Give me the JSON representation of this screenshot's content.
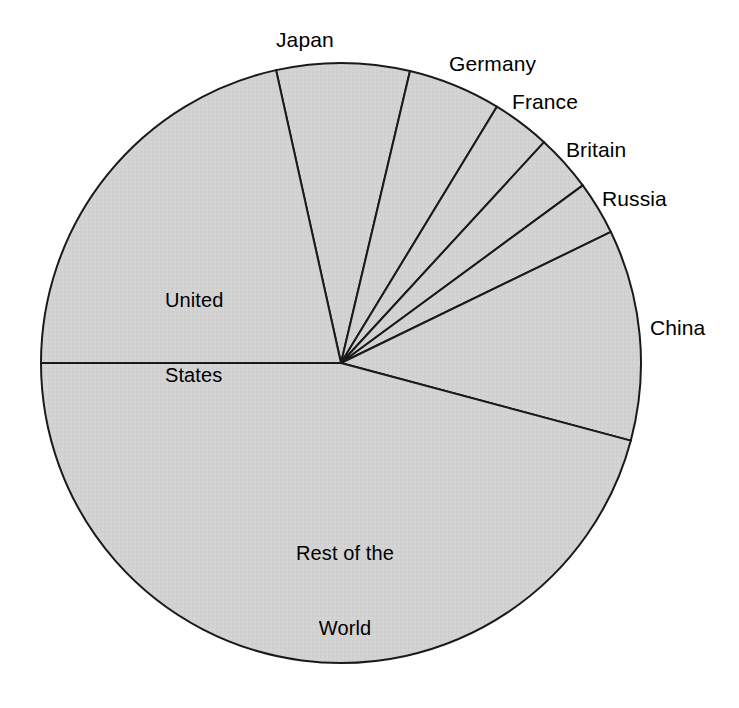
{
  "chart_data": {
    "type": "pie",
    "title": "",
    "subtitle": "",
    "xlabel": "",
    "ylabel": "",
    "legend_position": "none",
    "grid": false,
    "labels_placement": "outside-and-inside",
    "center": {
      "x": 341,
      "y": 363
    },
    "radius": 300,
    "start_angle_deg": -12.5,
    "direction": "clockwise",
    "fill_color": "#d2d2d2",
    "stroke_color": "#1a1a1a",
    "categories": [
      "Japan",
      "Germany",
      "France",
      "Britain",
      "Russia",
      "China",
      "Rest of the World",
      "United States"
    ],
    "values": [
      7.2,
      5.0,
      3.1,
      3.1,
      2.9,
      11.4,
      45.8,
      21.5
    ],
    "slices": [
      {
        "label": "Japan",
        "value": 7.2,
        "start_deg": -12.5,
        "end_deg": 13.3,
        "label_x": 276,
        "label_y": 27,
        "label_place": "outside"
      },
      {
        "label": "Germany",
        "value": 5.0,
        "start_deg": 13.3,
        "end_deg": 31.3,
        "label_x": 449,
        "label_y": 51,
        "label_place": "outside"
      },
      {
        "label": "France",
        "value": 3.1,
        "start_deg": 31.3,
        "end_deg": 42.6,
        "label_x": 512,
        "label_y": 89,
        "label_place": "outside"
      },
      {
        "label": "Britain",
        "value": 3.1,
        "start_deg": 42.6,
        "end_deg": 53.7,
        "label_x": 566,
        "label_y": 137,
        "label_place": "outside"
      },
      {
        "label": "Russia",
        "value": 2.9,
        "start_deg": 53.7,
        "end_deg": 64.1,
        "label_x": 602,
        "label_y": 186,
        "label_place": "outside"
      },
      {
        "label": "China",
        "value": 11.4,
        "start_deg": 64.1,
        "end_deg": 105.0,
        "label_x": 650,
        "label_y": 315,
        "label_place": "outside"
      },
      {
        "label": "Rest of the World",
        "value": 45.8,
        "start_deg": 105.0,
        "end_deg": 270.0,
        "label_x": 345,
        "label_y": 503,
        "label_place": "inside"
      },
      {
        "label": "United States",
        "value": 21.5,
        "start_deg": 270.0,
        "end_deg": 347.5,
        "label_x": 165,
        "label_y": 250,
        "label_place": "inside"
      }
    ]
  },
  "labels": {
    "japan": "Japan",
    "germany": "Germany",
    "france": "France",
    "britain": "Britain",
    "russia": "Russia",
    "china": "China",
    "united_states_line1": "United",
    "united_states_line2": "States",
    "rest_of_world_line1": "Rest of the",
    "rest_of_world_line2": "World"
  }
}
